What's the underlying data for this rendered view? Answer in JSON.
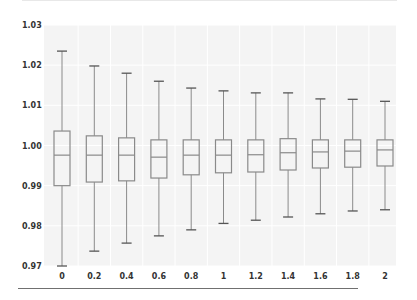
{
  "chart_data": {
    "type": "box",
    "title": "",
    "xlabel": "",
    "ylabel": "",
    "ylim": [
      0.97,
      1.03
    ],
    "yticks": [
      "1.03",
      "1.02",
      "1.01",
      "1.00",
      "0.99",
      "0.98",
      "0.97"
    ],
    "ytick_values": [
      1.03,
      1.02,
      1.01,
      1.0,
      0.99,
      0.98,
      0.97
    ],
    "categories": [
      "0",
      "0.2",
      "0.4",
      "0.6",
      "0.8",
      "1",
      "1.2",
      "1.4",
      "1.6",
      "1.8",
      "2"
    ],
    "grid": true,
    "legend": null,
    "boxes": [
      {
        "label": "0",
        "whisker_high": 1.0235,
        "q3": 1.0036,
        "median": 0.9976,
        "q1": 0.99,
        "whisker_low": 0.97
      },
      {
        "label": "0.2",
        "whisker_high": 1.0198,
        "q3": 1.0024,
        "median": 0.9976,
        "q1": 0.9909,
        "whisker_low": 0.9737
      },
      {
        "label": "0.4",
        "whisker_high": 1.018,
        "q3": 1.0019,
        "median": 0.9976,
        "q1": 0.9912,
        "whisker_low": 0.9757
      },
      {
        "label": "0.6",
        "whisker_high": 1.016,
        "q3": 1.0014,
        "median": 0.9971,
        "q1": 0.9919,
        "whisker_low": 0.9775
      },
      {
        "label": "0.8",
        "whisker_high": 1.0143,
        "q3": 1.0014,
        "median": 0.9976,
        "q1": 0.9927,
        "whisker_low": 0.979
      },
      {
        "label": "1",
        "whisker_high": 1.0136,
        "q3": 1.0014,
        "median": 0.9976,
        "q1": 0.9932,
        "whisker_low": 0.9806
      },
      {
        "label": "1.2",
        "whisker_high": 1.0131,
        "q3": 1.0014,
        "median": 0.9977,
        "q1": 0.9934,
        "whisker_low": 0.9814
      },
      {
        "label": "1.4",
        "whisker_high": 1.0131,
        "q3": 1.0017,
        "median": 0.9982,
        "q1": 0.9939,
        "whisker_low": 0.9822
      },
      {
        "label": "1.6",
        "whisker_high": 1.0116,
        "q3": 1.0014,
        "median": 0.9984,
        "q1": 0.9944,
        "whisker_low": 0.983
      },
      {
        "label": "1.8",
        "whisker_high": 1.0115,
        "q3": 1.0014,
        "median": 0.9986,
        "q1": 0.9946,
        "whisker_low": 0.9837
      },
      {
        "label": "2",
        "whisker_high": 1.011,
        "q3": 1.0014,
        "median": 0.9989,
        "q1": 0.9949,
        "whisker_low": 0.984
      }
    ]
  },
  "colors": {
    "box_stroke": "#8a8a8a",
    "median": "#8a8a8a",
    "whisker": "#8a8a8a",
    "cap": "#555555",
    "plot_bg": "#f4f4f4",
    "grid": "#ffffff",
    "tick_text": "#333333"
  }
}
